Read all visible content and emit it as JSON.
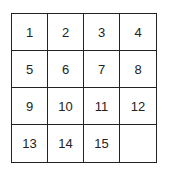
{
  "puzzle": {
    "tiles": [
      {
        "label": "1"
      },
      {
        "label": "2"
      },
      {
        "label": "3"
      },
      {
        "label": "4"
      },
      {
        "label": "5"
      },
      {
        "label": "6"
      },
      {
        "label": "7"
      },
      {
        "label": "8"
      },
      {
        "label": "9"
      },
      {
        "label": "10"
      },
      {
        "label": "11"
      },
      {
        "label": "12"
      },
      {
        "label": "13"
      },
      {
        "label": "14"
      },
      {
        "label": "15"
      },
      {
        "label": ""
      }
    ],
    "border_color": "#222222",
    "background": "#ffffff"
  }
}
